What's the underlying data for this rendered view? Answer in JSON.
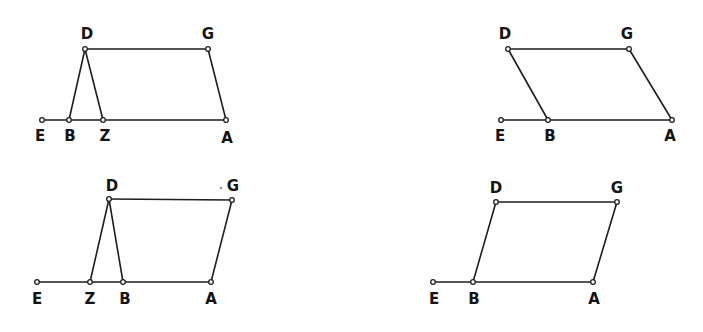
{
  "figures": [
    {
      "name": "figure-top-left",
      "points": {
        "E": {
          "x": 42,
          "y": 120,
          "lx": 40,
          "ly": 141
        },
        "B": {
          "x": 69,
          "y": 120,
          "lx": 70,
          "ly": 141
        },
        "Z": {
          "x": 103,
          "y": 120,
          "lx": 105,
          "ly": 141
        },
        "A": {
          "x": 226,
          "y": 120,
          "lx": 227,
          "ly": 143
        },
        "D": {
          "x": 85,
          "y": 49,
          "lx": 87,
          "ly": 39
        },
        "G": {
          "x": 208,
          "y": 49,
          "lx": 208,
          "ly": 39
        }
      },
      "segments": [
        [
          "E",
          "A"
        ],
        [
          "D",
          "G"
        ],
        [
          "D",
          "B"
        ],
        [
          "D",
          "Z"
        ],
        [
          "G",
          "A"
        ]
      ]
    },
    {
      "name": "figure-top-right",
      "points": {
        "E": {
          "x": 501,
          "y": 120,
          "lx": 500,
          "ly": 141
        },
        "B": {
          "x": 548,
          "y": 120,
          "lx": 550,
          "ly": 141
        },
        "A": {
          "x": 672,
          "y": 120,
          "lx": 670,
          "ly": 141
        },
        "D": {
          "x": 508,
          "y": 49,
          "lx": 505,
          "ly": 39
        },
        "G": {
          "x": 629,
          "y": 49,
          "lx": 627,
          "ly": 39
        }
      },
      "segments": [
        [
          "E",
          "A"
        ],
        [
          "D",
          "G"
        ],
        [
          "D",
          "B"
        ],
        [
          "G",
          "A"
        ]
      ]
    },
    {
      "name": "figure-bottom-left",
      "points": {
        "E": {
          "x": 37,
          "y": 282,
          "lx": 37,
          "ly": 304
        },
        "Z": {
          "x": 90,
          "y": 282,
          "lx": 90,
          "ly": 304
        },
        "B": {
          "x": 123,
          "y": 282,
          "lx": 125,
          "ly": 304
        },
        "A": {
          "x": 211,
          "y": 282,
          "lx": 211,
          "ly": 304
        },
        "D": {
          "x": 109,
          "y": 199,
          "lx": 112,
          "ly": 191
        },
        "G": {
          "x": 232,
          "y": 200,
          "lx": 233,
          "ly": 191
        }
      },
      "segments": [
        [
          "E",
          "A"
        ],
        [
          "D",
          "G"
        ],
        [
          "D",
          "Z"
        ],
        [
          "D",
          "B"
        ],
        [
          "G",
          "A"
        ]
      ]
    },
    {
      "name": "figure-bottom-right",
      "points": {
        "E": {
          "x": 433,
          "y": 282,
          "lx": 434,
          "ly": 304
        },
        "B": {
          "x": 473,
          "y": 282,
          "lx": 474,
          "ly": 304
        },
        "A": {
          "x": 593,
          "y": 282,
          "lx": 594,
          "ly": 304
        },
        "D": {
          "x": 496,
          "y": 202,
          "lx": 496,
          "ly": 193
        },
        "G": {
          "x": 617,
          "y": 202,
          "lx": 617,
          "ly": 193
        }
      },
      "segments": [
        [
          "E",
          "A"
        ],
        [
          "D",
          "G"
        ],
        [
          "D",
          "B"
        ],
        [
          "G",
          "A"
        ]
      ]
    }
  ],
  "specks": [
    {
      "x": 221,
      "y": 188
    }
  ],
  "colors": {
    "line": "#1e1e1e",
    "label": "#141414",
    "background": "#ffffff"
  }
}
